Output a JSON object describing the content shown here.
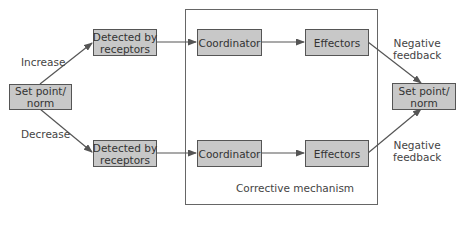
{
  "diagram": {
    "type": "flowchart",
    "colors": {
      "box_fill": "#c8c8c8",
      "box_border": "#555555",
      "line": "#555555",
      "text": "#333333"
    },
    "nodes": {
      "setpoint_left": {
        "label": "Set point/\nnorm"
      },
      "receptors_top": {
        "label": "Detected by\nreceptors"
      },
      "receptors_bottom": {
        "label": "Detected by\nreceptors"
      },
      "coordinator_top": {
        "label": "Coordinator"
      },
      "coordinator_bottom": {
        "label": "Coordinator"
      },
      "effectors_top": {
        "label": "Effectors"
      },
      "effectors_bottom": {
        "label": "Effectors"
      },
      "setpoint_right": {
        "label": "Set point/\nnorm"
      }
    },
    "edge_labels": {
      "increase": "Increase",
      "decrease": "Decrease",
      "neg_feedback_top": "Negative\nfeedback",
      "neg_feedback_bottom": "Negative\nfeedback"
    },
    "group": {
      "label": "Corrective mechanism"
    },
    "edges": [
      {
        "from": "setpoint_left",
        "to": "receptors_top",
        "label": "Increase"
      },
      {
        "from": "setpoint_left",
        "to": "receptors_bottom",
        "label": "Decrease"
      },
      {
        "from": "receptors_top",
        "to": "coordinator_top"
      },
      {
        "from": "coordinator_top",
        "to": "effectors_top"
      },
      {
        "from": "effectors_top",
        "to": "setpoint_right",
        "label": "Negative feedback"
      },
      {
        "from": "receptors_bottom",
        "to": "coordinator_bottom"
      },
      {
        "from": "coordinator_bottom",
        "to": "effectors_bottom"
      },
      {
        "from": "effectors_bottom",
        "to": "setpoint_right",
        "label": "Negative feedback"
      }
    ]
  }
}
